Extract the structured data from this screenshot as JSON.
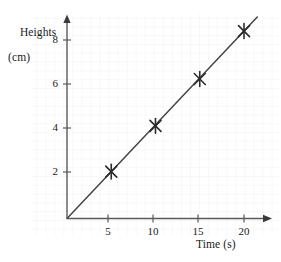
{
  "chart_data": {
    "type": "scatter",
    "title": "",
    "subtitle": "",
    "xlabel": "Time (s)",
    "ylabel": "Heights (cm)",
    "ylabel_lines": [
      "Heights",
      "(cm)"
    ],
    "x": [
      5,
      10,
      15,
      20
    ],
    "values": [
      2.1,
      4.15,
      6.25,
      8.4
    ],
    "series": [
      {
        "name": "Height measurements",
        "marker": "cross-star",
        "x": [
          5,
          10,
          15,
          20
        ],
        "values": [
          2.1,
          4.15,
          6.25,
          8.4
        ]
      }
    ],
    "trendline": {
      "type": "line-of-best-fit",
      "through_origin": true,
      "slope": 0.42,
      "intercept": 0,
      "x_start": 0,
      "x_end": 21.5
    },
    "xlim": [
      0,
      23
    ],
    "ylim": [
      0,
      9.1
    ],
    "xticks": [
      5,
      10,
      15,
      20
    ],
    "yticks": [
      2,
      4,
      6,
      8
    ],
    "xtick_labels": [
      "5",
      "10",
      "15",
      "20"
    ],
    "ytick_labels": [
      "2",
      "4",
      "6",
      "8"
    ],
    "grid": true,
    "grid_minor_step_x": 1,
    "grid_minor_step_y": 0.4,
    "legend": null,
    "legend_position": "none",
    "annotations": [],
    "colors": {
      "line": "#444444",
      "marker": "#2b2b2b",
      "axis": "#555555",
      "grid": "#e3e8ef",
      "text": "#1a1a1a",
      "background": "#ffffff"
    },
    "axis_style": {
      "arrow_heads": true,
      "x_axis_arrow": true,
      "y_axis_arrow": true
    }
  },
  "axes": {
    "y_title_line1": "Heights",
    "y_title_line2": "(cm)",
    "x_title": "Time (s)"
  },
  "ticks": {
    "y": [
      {
        "label": "8",
        "value": 8
      },
      {
        "label": "6",
        "value": 6
      },
      {
        "label": "4",
        "value": 4
      },
      {
        "label": "2",
        "value": 2
      }
    ],
    "x": [
      {
        "label": "5",
        "value": 5
      },
      {
        "label": "10",
        "value": 10
      },
      {
        "label": "15",
        "value": 15
      },
      {
        "label": "20",
        "value": 20
      }
    ]
  }
}
